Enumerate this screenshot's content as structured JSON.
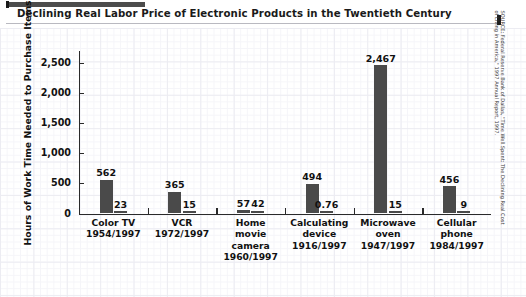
{
  "title": "Declining Real Labor Price of Electronic Products in the Twentieth Century",
  "source_note": "SOURCE: Federal Reserve Bank of Dallas, \"Time Well Spent: The Declining Real Cost\nof Living in America,\" 1997 Annual Report, 1997.",
  "colors": {
    "bar": "#4a4a4a",
    "axis": "#2a2a2a",
    "text": "#111111",
    "accent": "#4c4c4c",
    "grid_major": "#ececf2",
    "grid_minor": "#f5f5f9",
    "background": "#ffffff"
  },
  "chart_data": {
    "type": "bar",
    "title": "Declining Real Labor Price of Electronic Products in the Twentieth Century",
    "xlabel": "",
    "ylabel": "Hours of Work Time Needed to Purchase Items",
    "ylim": [
      0,
      2700
    ],
    "yticks": [
      0,
      500,
      1000,
      1500,
      2000,
      2500
    ],
    "ytick_labels": [
      "0",
      "500",
      "1,000",
      "1,500",
      "2,000",
      "2,500"
    ],
    "grid": true,
    "legend": false,
    "categories": [
      "Color TV\n1954/1997",
      "VCR\n1972/1997",
      "Home\nmovie\ncamera\n1960/1997",
      "Calculating\ndevice\n1916/1997",
      "Microwave\noven\n1947/1997",
      "Cellular\nphone\n1984/1997"
    ],
    "series": [
      {
        "name": "Introduction year",
        "values": [
          562,
          365,
          57,
          494,
          2467,
          456
        ],
        "value_labels": [
          "562",
          "365",
          "57",
          "494",
          "2,467",
          "456"
        ]
      },
      {
        "name": "1997",
        "values": [
          23,
          15,
          42,
          0.76,
          15,
          9
        ],
        "value_labels": [
          "23",
          "15",
          "42",
          "0.76",
          "15",
          "9"
        ]
      }
    ]
  }
}
